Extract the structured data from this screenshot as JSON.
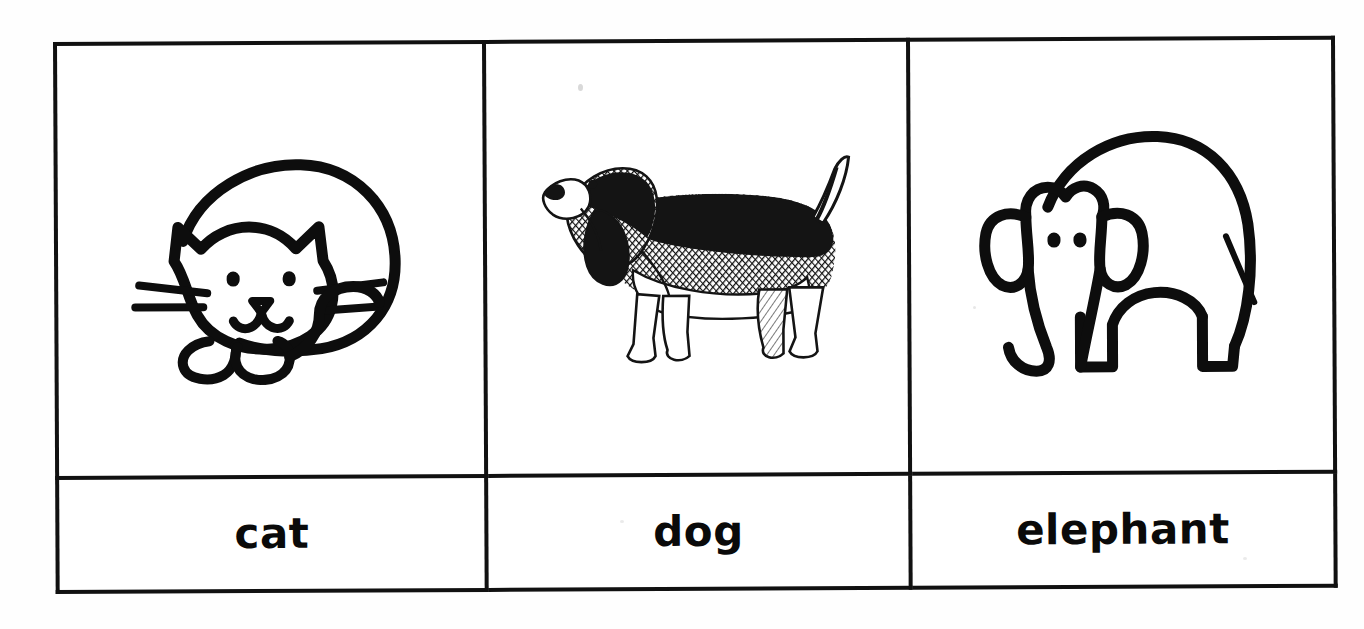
{
  "document": {
    "kind": "worksheet-picture-table",
    "title": "Animal vocabulary picture table",
    "background_color": "#fefefe",
    "ink_color": "#0d0d0d",
    "border_color": "#111111",
    "border_width_px": 4
  },
  "table": {
    "rows": 2,
    "columns": 3,
    "picture_row_label": "pictures",
    "word_row_label": "words"
  },
  "cells": [
    {
      "index": 0,
      "word": "cat",
      "picture_name": "cat-drawing",
      "picture_style": "simple black outline doodle",
      "picture_description": "curled-up sleeping cat seen from the side, round body, head with two pointed ears, two dot eyes, triangular nose, smiling mouth, three whiskers each side, two rounded front paws and a tail curling over the body"
    },
    {
      "index": 1,
      "word": "dog",
      "picture_name": "dog-drawing",
      "picture_style": "crosshatched engraving clip-art",
      "picture_description": "basset hound standing in profile facing left, long drooping ears, long low body with dark hatched back, white underside, short legs and a tail raised up to the right"
    },
    {
      "index": 2,
      "word": "elephant",
      "picture_name": "elephant-drawing",
      "picture_style": "simple black outline doodle",
      "picture_description": "elephant seen from the side facing left, large domed body, big rounded ears, two dot eyes, trunk curving down and hooking forward, four stumpy legs and a thin tail"
    }
  ],
  "words": {
    "cat": "cat",
    "dog": "dog",
    "elephant": "elephant"
  }
}
